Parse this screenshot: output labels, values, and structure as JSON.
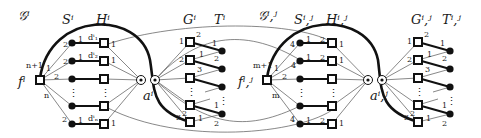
{
  "left_gadget": {
    "title": "𝒢ⁱ",
    "cols": {
      "S": "Sⁱ",
      "H": "Hⁱ",
      "G": "Gⁱ",
      "T": "Tⁱ"
    },
    "f_label": "fⁱ",
    "a_label": "aⁱ",
    "f_edge_labels": {
      "top": "n+1",
      "one": "1",
      "two": "2",
      "n": "n"
    },
    "d_labels": [
      "dⁱ₁",
      "dⁱ₂",
      "dⁱₙ"
    ]
  },
  "right_gadget": {
    "title": "𝒢ⁱ,ʲ",
    "cols": {
      "S": "Sⁱ,ʲ",
      "H": "Hⁱ,ʲ",
      "G": "Gⁱ,ʲ",
      "T": "Tⁱ,ʲ"
    },
    "f_label": "fⁱ,ʲ",
    "a_label": "aⁱ,ʲ",
    "f_edge_labels": {
      "top": "m+1",
      "one": "1",
      "two": "2",
      "m": "m"
    }
  },
  "port_labels": {
    "one": "1",
    "two": "2",
    "three": "3",
    "four": "4"
  },
  "ellipsis": "⋮"
}
